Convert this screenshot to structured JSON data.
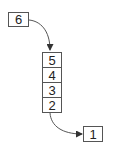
{
  "diagram": {
    "type": "stack-push-pop",
    "incoming": {
      "label": "6"
    },
    "stack": {
      "items": [
        "5",
        "4",
        "3",
        "2"
      ]
    },
    "outgoing": {
      "label": "1"
    },
    "colors": {
      "stroke": "#555555",
      "text": "#222222",
      "background": "#ffffff"
    }
  }
}
